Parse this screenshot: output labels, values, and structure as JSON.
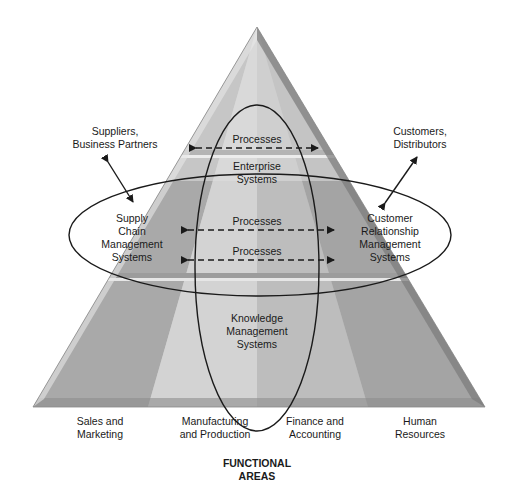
{
  "diagram": {
    "type": "pyramid",
    "external": {
      "suppliers": "Suppliers,\nBusiness Partners",
      "customers": "Customers,\nDistributors"
    },
    "top_band": {
      "process_label": "Processes",
      "enterprise_label": "Enterprise\nSystems"
    },
    "middle_band": {
      "scm_label": "Supply\nChain\nManagement\nSystems",
      "crm_label": "Customer\nRelationship\nManagement\nSystems",
      "process_labels": [
        "Processes",
        "Processes"
      ]
    },
    "bottom_band": {
      "kms_label": "Knowledge\nManagement\nSystems"
    },
    "functional_areas": [
      "Sales and\nMarketing",
      "Manufacturing\nand Production",
      "Finance and\nAccounting",
      "Human\nResources"
    ],
    "footer_title": "FUNCTIONAL\nAREAS",
    "colors": {
      "face_light": "#d6d6d6",
      "face_mid": "#c4c4c4",
      "face_dark": "#a8a8a8",
      "bevel_dark": "#7e7e7e",
      "line": "#1a1a1a"
    }
  }
}
